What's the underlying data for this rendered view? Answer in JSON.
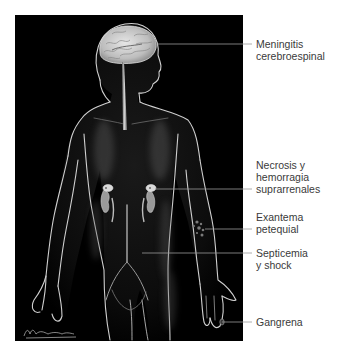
{
  "figure": {
    "background_color": "#000000",
    "outline_color": "#d8d8d8",
    "leader_line_color": "#9a9a9a",
    "signature": "M.Tiburón"
  },
  "labels": [
    {
      "id": "meningitis",
      "lines": [
        "Meningitis",
        "cerebroespinal"
      ],
      "target": "brain"
    },
    {
      "id": "necrosis",
      "lines": [
        "Necrosis y",
        "hemorragia",
        "suprarrenales"
      ],
      "target": "adrenal-glands"
    },
    {
      "id": "exantema",
      "lines": [
        "Exantema",
        "petequial"
      ],
      "target": "forearm-skin"
    },
    {
      "id": "septicemia",
      "lines": [
        "Septicemia",
        "y shock"
      ],
      "target": "blood-vessels"
    },
    {
      "id": "gangrena",
      "lines": [
        "Gangrena"
      ],
      "target": "fingertips"
    }
  ]
}
